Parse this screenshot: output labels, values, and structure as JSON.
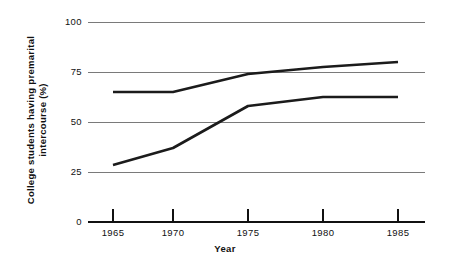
{
  "chart_data": {
    "type": "line",
    "title": "",
    "xlabel": "Year",
    "ylabel": "College students having premarital intercourse (%)",
    "ylabel_line1": "College students having premarital",
    "ylabel_line2": "intercourse (%)",
    "x": [
      1965,
      1970,
      1975,
      1980,
      1985
    ],
    "categories": [
      "1965",
      "1970",
      "1975",
      "1980",
      "1985"
    ],
    "xlim": [
      1963,
      1988
    ],
    "ylim": [
      0,
      100
    ],
    "yticks": [
      0,
      25,
      50,
      75,
      100
    ],
    "ytick_labels": [
      "0",
      "25",
      "50",
      "75",
      "100"
    ],
    "xtick_labels": [
      "1965",
      "1970",
      "1975",
      "1980",
      "1985"
    ],
    "grid": "horizontal",
    "legend": "none",
    "series": [
      {
        "name": "upper-series",
        "values": [
          65,
          65,
          74,
          77.5,
          80
        ],
        "color": "#1b1b1b"
      },
      {
        "name": "lower-series",
        "values": [
          28.5,
          37,
          58,
          62.5,
          62.5
        ],
        "color": "#1b1b1b"
      }
    ],
    "colors": {
      "line": "#1b1b1b",
      "gridline": "#7a7a7a",
      "axis": "#111111",
      "background": "#ffffff",
      "text": "#111111"
    }
  }
}
